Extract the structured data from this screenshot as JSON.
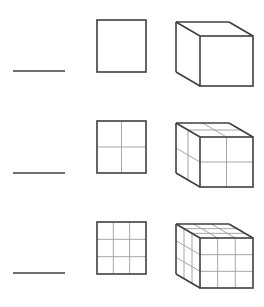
{
  "figure": {
    "background_color": "#ffffff",
    "outline_color": "#3f3f3f",
    "grid_color": "#9c9c9c",
    "outline_width": 1.6,
    "grid_width": 0.9,
    "canvas": {
      "width": 264,
      "height": 307
    },
    "rows": [
      {
        "row_index": 1,
        "divisions": 1,
        "line": {
          "label": "line-segment-1",
          "x1": 13,
          "y1": 71,
          "x2": 65,
          "y2": 71,
          "length_units": 1,
          "segments": 1
        },
        "square": {
          "label": "square-1x1",
          "x": 97,
          "y": 20,
          "width": 49,
          "height": 52,
          "cells": 1,
          "cols": 1,
          "rows": 1
        },
        "cube": {
          "label": "cube-1x1x1",
          "front_x": 200,
          "front_y": 36,
          "front_w": 53,
          "front_h": 50,
          "depth_dx": -24,
          "depth_dy": -14,
          "cells": 1,
          "cols": 1,
          "rows": 1
        }
      },
      {
        "row_index": 2,
        "divisions": 2,
        "line": {
          "label": "line-segment-2",
          "x1": 13,
          "y1": 173,
          "x2": 65,
          "y2": 173,
          "length_units": 1,
          "segments": 1
        },
        "square": {
          "label": "square-2x2",
          "x": 97,
          "y": 121,
          "width": 49,
          "height": 52,
          "cells": 4,
          "cols": 2,
          "rows": 2
        },
        "cube": {
          "label": "cube-2x2x2",
          "front_x": 200,
          "front_y": 137,
          "front_w": 53,
          "front_h": 50,
          "depth_dx": -24,
          "depth_dy": -14,
          "cells": 8,
          "cols": 2,
          "rows": 2
        }
      },
      {
        "row_index": 3,
        "divisions": 3,
        "line": {
          "label": "line-segment-3",
          "x1": 13,
          "y1": 273,
          "x2": 65,
          "y2": 273,
          "length_units": 1,
          "segments": 1
        },
        "square": {
          "label": "square-3x3",
          "x": 97,
          "y": 222,
          "width": 49,
          "height": 52,
          "cells": 9,
          "cols": 3,
          "rows": 3
        },
        "cube": {
          "label": "cube-3x3x3",
          "front_x": 200,
          "front_y": 238,
          "front_w": 53,
          "front_h": 50,
          "depth_dx": -24,
          "depth_dy": -14,
          "cells": 27,
          "cols": 3,
          "rows": 3
        }
      }
    ],
    "columns": [
      {
        "label": "one-dimensional",
        "shape": "line"
      },
      {
        "label": "two-dimensional",
        "shape": "square"
      },
      {
        "label": "three-dimensional",
        "shape": "cube"
      }
    ]
  }
}
